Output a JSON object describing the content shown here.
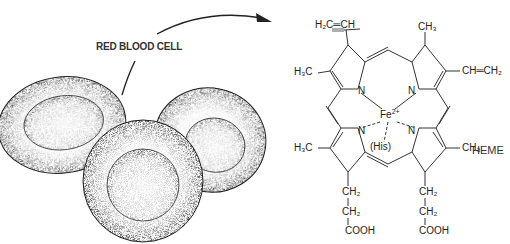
{
  "figure": {
    "left_panel": {
      "label": "RED BLOOD CELL",
      "cell_count": 3
    },
    "right_panel": {
      "title": "HEME",
      "substituents": {
        "top_left_vinyl": "H₂C═CH",
        "top_right_methyl": "CH₃",
        "left_upper_methyl": "H₃C",
        "right_upper_vinyl": "CH═CH₂",
        "left_lower_methyl": "H₃C",
        "right_lower_methyl": "CH₃",
        "left_chain": [
          "CH₂",
          "CH₂",
          "COOH"
        ],
        "right_chain": [
          "CH₂",
          "CH₂",
          "COOH"
        ]
      },
      "center_atom": "Fe",
      "center_charge": "2+",
      "nitrogen_label": "N",
      "axial_ligand": "(His)"
    },
    "colors": {
      "ink": "#222222",
      "stipple": "#555555",
      "background": "#ffffff"
    }
  }
}
